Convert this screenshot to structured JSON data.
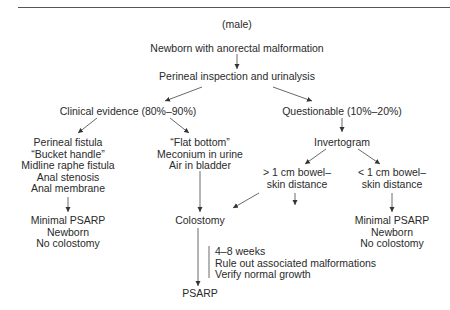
{
  "header": {
    "subtitle": "(male)"
  },
  "nodes": {
    "start": "Newborn with anorectal malformation",
    "inspection": "Perineal inspection and urinalysis",
    "clinical": "Clinical evidence (80%–90%)",
    "questionable": "Questionable (10%–20%)",
    "invertogram": "Invertogram",
    "perineal_findings": [
      "Perineal fistula",
      "“Bucket handle”",
      "Midline raphe fistula",
      "Anal stenosis",
      "Anal membrane"
    ],
    "other_findings": [
      "“Flat bottom”",
      "Meconium in urine",
      "Air in bladder"
    ],
    "gt1cm": [
      "> 1 cm bowel–",
      "skin distance"
    ],
    "lt1cm": [
      "< 1 cm bowel–",
      "skin distance"
    ],
    "minimal_left": [
      "Minimal PSARP",
      "Newborn",
      "No colostomy"
    ],
    "colostomy": "Colostomy",
    "minimal_right": [
      "Minimal PSARP",
      "Newborn",
      "No colostomy"
    ],
    "notes": [
      "4–8 weeks",
      "Rule out associated malformations",
      "Verify normal growth"
    ],
    "psarp": "PSARP"
  }
}
